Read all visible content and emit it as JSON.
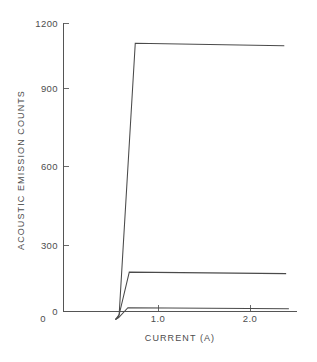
{
  "chart_data": {
    "type": "line",
    "title": "",
    "xlabel": "CURRENT (A)",
    "ylabel": "ACOUSTIC EMISSION COUNTS",
    "xlim": [
      0,
      2.45
    ],
    "ylim": [
      0,
      1200
    ],
    "xticks": [
      0,
      1.0,
      2.0
    ],
    "xtick_labels": [
      "0",
      "1.0",
      "2.0"
    ],
    "yticks": [
      0,
      300,
      600,
      900,
      1200
    ],
    "ytick_labels": [
      "0",
      "300",
      "600",
      "900",
      "1200"
    ],
    "grid": false,
    "legend": "none",
    "series": [
      {
        "name": "curve-upper",
        "x": [
          0.565,
          0.605,
          0.78,
          2.4
        ],
        "y": [
          0,
          20,
          1120,
          1110
        ]
      },
      {
        "name": "curve-middle",
        "x": [
          0.565,
          0.6,
          0.715,
          2.42
        ],
        "y": [
          0,
          12,
          192,
          186
        ]
      },
      {
        "name": "curve-lower",
        "x": [
          0.565,
          0.6,
          0.7,
          2.45
        ],
        "y": [
          0,
          8,
          48,
          44
        ]
      }
    ]
  },
  "axes": {
    "x_title": "CURRENT (A)",
    "y_title": "ACOUSTIC EMISSION COUNTS",
    "x_tick_labels": [
      "0",
      "1.0",
      "2.0"
    ],
    "y_tick_labels": [
      "1200",
      "900",
      "600",
      "300",
      "0"
    ]
  },
  "colors": {
    "background": "#ffffff",
    "line": "#4a4a4a",
    "axis": "#555555",
    "text": "#4d4d4d"
  }
}
